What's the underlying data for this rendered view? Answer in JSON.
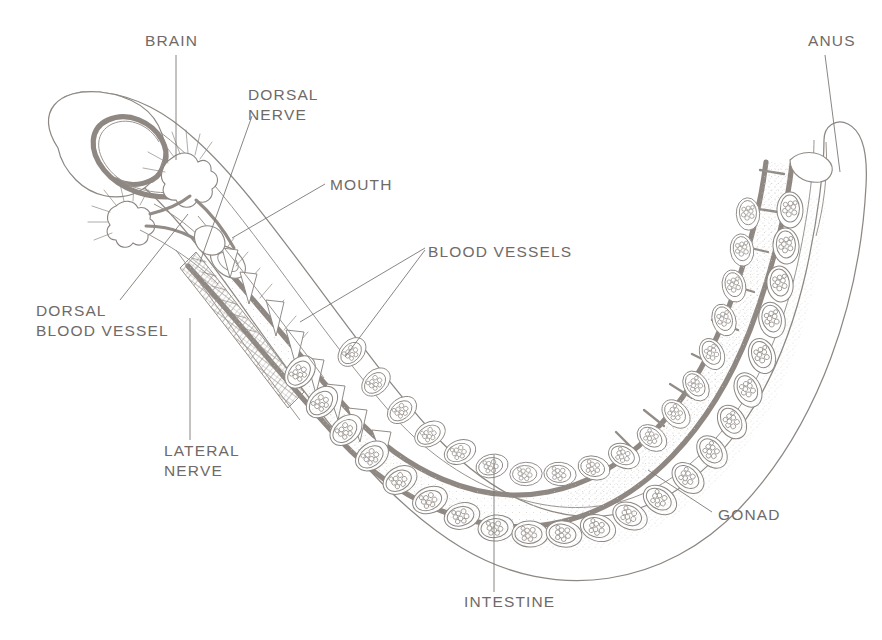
{
  "figure": {
    "title_visible": false,
    "orientation": "u-shaped body, head at upper left, tail at upper right",
    "background_color": "#ffffff",
    "ink_color": "#8c8783",
    "label_color": "#6f6a67"
  },
  "labels": [
    {
      "id": "brain",
      "text": "BRAIN",
      "lines": [
        "BRAIN"
      ],
      "x": 145,
      "y": 46,
      "anchor": "start"
    },
    {
      "id": "anus",
      "text": "ANUS",
      "lines": [
        "ANUS"
      ],
      "x": 808,
      "y": 46,
      "anchor": "start"
    },
    {
      "id": "dorsal-nerve",
      "text": "DORSAL NERVE",
      "lines": [
        "DORSAL",
        "NERVE"
      ],
      "x": 248,
      "y": 100,
      "anchor": "start"
    },
    {
      "id": "mouth",
      "text": "MOUTH",
      "lines": [
        "MOUTH"
      ],
      "x": 330,
      "y": 190,
      "anchor": "start"
    },
    {
      "id": "blood-vessels",
      "text": "BLOOD VESSELS",
      "lines": [
        "BLOOD VESSELS"
      ],
      "x": 428,
      "y": 257,
      "anchor": "start"
    },
    {
      "id": "dorsal-blood-vessel",
      "text": "DORSAL BLOOD VESSEL",
      "lines": [
        "DORSAL",
        "BLOOD VESSEL"
      ],
      "x": 36,
      "y": 316,
      "anchor": "start"
    },
    {
      "id": "lateral-nerve",
      "text": "LATERAL NERVE",
      "lines": [
        "LATERAL",
        "NERVE"
      ],
      "x": 164,
      "y": 456,
      "anchor": "start"
    },
    {
      "id": "gonad",
      "text": "GONAD",
      "lines": [
        "GONAD"
      ],
      "x": 718,
      "y": 520,
      "anchor": "start"
    },
    {
      "id": "intestine",
      "text": "INTESTINE",
      "lines": [
        "INTESTINE"
      ],
      "x": 464,
      "y": 607,
      "anchor": "start"
    }
  ],
  "leaders": [
    {
      "id": "leader-brain",
      "d": "M 176 55 L 176 160"
    },
    {
      "id": "leader-anus",
      "d": "M 825 55 L 840 172"
    },
    {
      "id": "leader-dorsal-nerve",
      "d": "M 252 116 L 200 262"
    },
    {
      "id": "leader-mouth",
      "d": "M 325 184 L 232 238"
    },
    {
      "id": "leader-blood-vessels-a",
      "d": "M 425 248 L 300 322"
    },
    {
      "id": "leader-blood-vessels-b",
      "d": "M 425 250 L 345 357"
    },
    {
      "id": "leader-dorsal-blood-vessel",
      "d": "M 120 300 L 188 214"
    },
    {
      "id": "leader-lateral-nerve",
      "d": "M 190 440 L 190 318"
    },
    {
      "id": "leader-gonad",
      "d": "M 712 512 L 648 470"
    },
    {
      "id": "leader-intestine",
      "d": "M 494 592 L 494 455"
    }
  ],
  "anatomy": {
    "body_outline": "U-shaped tube with rounded proboscis lobe at anterior left and tapering tail at posterior right",
    "gut_tube": "continuous intestine running the length of the body from mouth to anus",
    "structures": [
      {
        "name": "proboscis",
        "note": "rounded anterior lobe containing looping dorsal blood vessel"
      },
      {
        "name": "brain-ganglion",
        "note": "star shaped nerve node with radiating fibers, dorsal"
      },
      {
        "name": "collar-ganglion",
        "note": "second smaller nerve node with radiating fibers, ventral"
      },
      {
        "name": "pharyngeal-basket",
        "note": "cross hatched gill mesh just behind the mouth"
      },
      {
        "name": "gill-bars",
        "note": "row of triangular tooth like projections along the anterior gut"
      },
      {
        "name": "gonad-row-outer",
        "note": "teardrop sacs filled with eggs along outer body wall"
      },
      {
        "name": "gonad-row-inner",
        "note": "teardrop sacs filled with eggs along the gut tube"
      },
      {
        "name": "septa",
        "note": "rung like cross bars in the posterior trunk"
      }
    ],
    "gonad_count_outer": 22,
    "gonad_count_inner": 20,
    "gill_bar_count": 13,
    "septa_count": 9
  }
}
